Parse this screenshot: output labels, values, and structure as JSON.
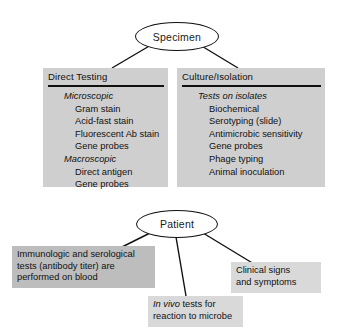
{
  "diagram": {
    "colors": {
      "panel_fill": "#cfcfcf",
      "note_dark_fill": "#bdbdbd",
      "note_light_fill": "#d9d9d9",
      "line": "#111111",
      "text": "#111111"
    },
    "nodes": {
      "specimen": {
        "label": "Specimen"
      },
      "patient": {
        "label": "Patient"
      }
    },
    "panels": [
      {
        "id": "direct-testing",
        "title": "Direct Testing",
        "groups": [
          {
            "heading": "Microscopic",
            "items": [
              "Gram stain",
              "Acid-fast stain",
              "Fluorescent Ab stain",
              "Gene probes"
            ]
          },
          {
            "heading": "Macroscopic",
            "items": [
              "Direct antigen",
              "Gene probes"
            ]
          }
        ]
      },
      {
        "id": "culture-isolation",
        "title": "Culture/Isolation",
        "groups": [
          {
            "heading": "Tests on isolates",
            "items": [
              "Biochemical",
              "Serotyping (slide)",
              "Antimicrobic sensitivity",
              "Gene probes",
              "Phage typing",
              "Animal inoculation"
            ]
          }
        ]
      }
    ],
    "notes": [
      {
        "id": "serology-note",
        "line1": "Immunologic and serological",
        "line2": "tests (antibody titer) are",
        "line3": "performed on blood"
      },
      {
        "id": "clinical-signs-note",
        "line1": "Clinical signs",
        "line2": "and symptoms"
      },
      {
        "id": "in-vivo-note",
        "italic_lead": "In vivo",
        "line1_rest": " tests for",
        "line2": "reaction to microbe"
      }
    ]
  }
}
